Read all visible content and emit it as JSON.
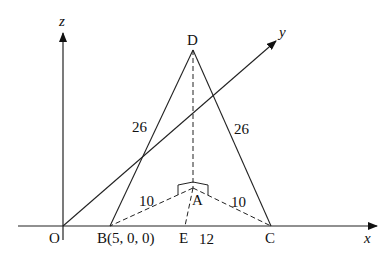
{
  "diagram": {
    "axes": {
      "x_label": "x",
      "y_label": "y",
      "z_label": "z",
      "origin_label": "O"
    },
    "points": {
      "D": "D",
      "B": "B(5, 0, 0)",
      "C": "C",
      "A": "A",
      "E": "E"
    },
    "lengths": {
      "DB": "26",
      "DC": "26",
      "AB": "10",
      "AC": "10",
      "EC": "12"
    },
    "colors": {
      "stroke": "#222222",
      "background": "#ffffff"
    }
  }
}
